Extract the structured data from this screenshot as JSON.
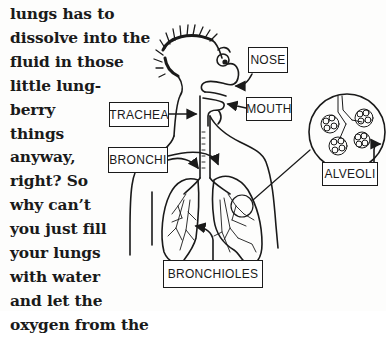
{
  "paragraph": {
    "lines": [
      "lungs has to",
      "dissolve into the",
      "fluid in those",
      "little lung-",
      "berry",
      "things",
      "anyway,",
      "right? So",
      "why can’t",
      "you just fill",
      "your lungs",
      "with water",
      "and let the",
      "oxygen from the"
    ]
  },
  "diagram": {
    "labels": {
      "nose": "NOSE",
      "mouth": "MOUTH",
      "trachea": "TRACHEA",
      "bronchi": "BRONCHI",
      "alveoli": "ALVEOLI",
      "bronchioles": "BRONCHIOLES"
    },
    "colors": {
      "ink": "#1a1a1a",
      "paper": "#fdfdfc"
    }
  }
}
